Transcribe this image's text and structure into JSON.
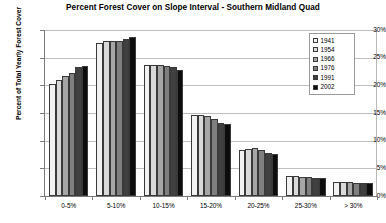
{
  "chart_data": {
    "type": "bar",
    "title": "Percent Forest Cover on Slope Interval - Southern Midland Quad",
    "xlabel": "",
    "ylabel": "Percent of Total Yearly Forest Cover",
    "categories": [
      "0-5%",
      "5-10%",
      "10-15%",
      "15-20%",
      "20-25%",
      "25-30%",
      "> 30%"
    ],
    "ylim": [
      0,
      30
    ],
    "ytick_labels": [
      "0%",
      "5%",
      "10%",
      "15%",
      "20%",
      "25%",
      "30%"
    ],
    "ytick_values": [
      0,
      5,
      10,
      15,
      20,
      25,
      30
    ],
    "grid": true,
    "legend_position": "top-right",
    "series": [
      {
        "name": "1941",
        "color": "#f2f2f2",
        "values": [
          20.3,
          27.6,
          23.6,
          14.6,
          8.3,
          3.6,
          2.6
        ]
      },
      {
        "name": "1954",
        "color": "#d9d9d9",
        "values": [
          21.0,
          28.0,
          23.6,
          14.6,
          8.5,
          3.6,
          2.6
        ]
      },
      {
        "name": "1966",
        "color": "#a6a6a6",
        "values": [
          21.6,
          28.0,
          23.7,
          14.5,
          8.6,
          3.5,
          2.5
        ]
      },
      {
        "name": "1976",
        "color": "#7f7f7f",
        "values": [
          22.3,
          28.1,
          23.5,
          14.0,
          8.4,
          3.4,
          2.4
        ]
      },
      {
        "name": "1991",
        "color": "#404040",
        "values": [
          23.4,
          28.4,
          23.3,
          13.2,
          7.8,
          3.3,
          2.3
        ]
      },
      {
        "name": "2002",
        "color": "#0d0d0d",
        "values": [
          23.5,
          28.8,
          22.8,
          13.0,
          7.6,
          3.3,
          2.4
        ]
      }
    ]
  }
}
